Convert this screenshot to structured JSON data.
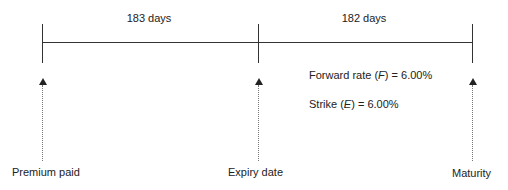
{
  "timeline": {
    "periods": [
      {
        "label": "183 days",
        "center_x": 149
      },
      {
        "label": "182 days",
        "center_x": 364
      }
    ],
    "points": [
      {
        "label": "Premium paid",
        "x": 42
      },
      {
        "label": "Expiry date",
        "x": 258
      },
      {
        "label": "Maturity",
        "x": 472
      }
    ]
  },
  "annotations": {
    "forward": {
      "prefix": "Forward rate (",
      "symbol": "F",
      "suffix": ") = 6.00%"
    },
    "strike": {
      "prefix": "Strike (",
      "symbol": "E",
      "suffix": ") = 6.00%"
    }
  }
}
